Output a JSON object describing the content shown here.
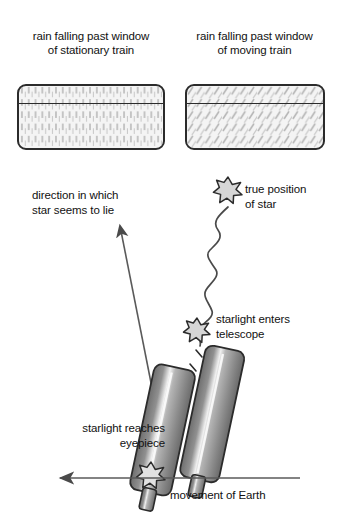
{
  "diagram": {
    "panels": [
      {
        "id": "stationary",
        "caption_line1": "rain falling past window",
        "caption_line2": "of stationary train",
        "rain_direction": "vertical",
        "rain_angle_deg": 0
      },
      {
        "id": "moving",
        "caption_line1": "rain falling past window",
        "caption_line2": "of moving train",
        "rain_direction": "slanted",
        "rain_angle_deg": 30
      }
    ],
    "labels": {
      "direction_line1": "direction in which",
      "direction_line2": "star seems to lie",
      "true_position_line1": "true position",
      "true_position_line2": "of star",
      "enters_line1": "starlight enters",
      "enters_line2": "telescope",
      "eyepiece_line1": "starlight reaches",
      "eyepiece_line2": "eyepiece",
      "movement": "movement of Earth"
    },
    "icons": {
      "star_true": "star-burst-icon",
      "star_entry": "star-burst-icon",
      "star_eyepiece": "star-burst-icon",
      "apparent_arrow": "arrow-up-left-icon",
      "motion_arrow": "arrow-left-icon",
      "light_path": "wavy-line-icon",
      "telescope_a": "telescope-tube-icon",
      "telescope_b": "telescope-tube-icon"
    },
    "colors": {
      "ink": "#1a1a1a",
      "outline": "#2b2b2b",
      "window_fill": "#f4f4f4",
      "rain_streak": "#b9b9b9",
      "star_fill": "#d6d6d6",
      "tube_dark": "#6e6e6e",
      "tube_mid": "#9a9a9a",
      "tube_light": "#e8e8e8",
      "arrow": "#4a4a4a"
    }
  }
}
